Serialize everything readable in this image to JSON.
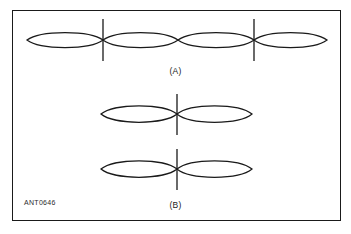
{
  "figure": {
    "id_code": "ANT0646",
    "frame": {
      "x": 12,
      "y": 10,
      "width": 329,
      "height": 211,
      "stroke_color": "#1a1a1a",
      "stroke_width": 1.6
    },
    "background_color": "#ffffff",
    "line_color": "#1a1a1a"
  },
  "panels": [
    {
      "label": "(A)",
      "name": "panel-a",
      "description": "four-lobe radiation pattern with two vertical center lines",
      "lobe_count": 4,
      "tick_count": 2,
      "axis_y": 40,
      "lobes": [
        {
          "x_start": 27,
          "x_end": 103,
          "half_height": 10
        },
        {
          "x_start": 103,
          "x_end": 178,
          "half_height": 10
        },
        {
          "x_start": 178,
          "x_end": 254,
          "half_height": 10
        },
        {
          "x_start": 254,
          "x_end": 327,
          "half_height": 10
        }
      ],
      "ticks": [
        {
          "x": 103,
          "y_top": 19,
          "y_bottom": 61
        },
        {
          "x": 254,
          "y_top": 19,
          "y_bottom": 61
        }
      ],
      "label_y": 66
    },
    {
      "label": "(B)",
      "name": "panel-b",
      "description": "two identical figure-eight dipole patterns, each with one vertical center line",
      "figure_count": 2,
      "figures": [
        {
          "name": "dipole-pattern-upper",
          "axis_y": 114,
          "lobes": [
            {
              "x_start": 101,
              "x_end": 177,
              "half_height": 11
            },
            {
              "x_start": 177,
              "x_end": 252,
              "half_height": 11
            }
          ],
          "tick": {
            "x": 177,
            "y_top": 94,
            "y_bottom": 135
          }
        },
        {
          "name": "dipole-pattern-lower",
          "axis_y": 169,
          "lobes": [
            {
              "x_start": 101,
              "x_end": 177,
              "half_height": 11
            },
            {
              "x_start": 177,
              "x_end": 252,
              "half_height": 11
            }
          ],
          "tick": {
            "x": 177,
            "y_top": 149,
            "y_bottom": 190
          }
        }
      ],
      "label_y": 200
    }
  ]
}
